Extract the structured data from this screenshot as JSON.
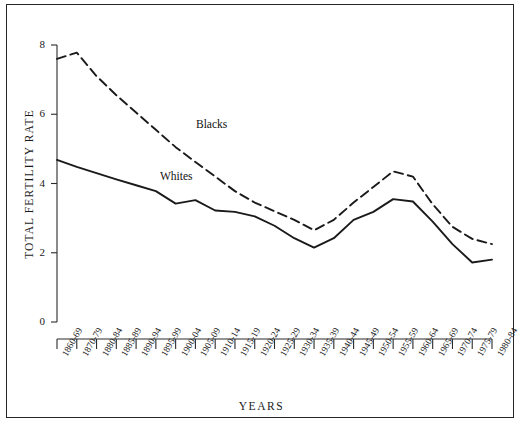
{
  "chart_data": {
    "type": "line",
    "title": "",
    "xlabel": "YEARS",
    "ylabel": "TOTAL FERTILITY RATE",
    "ylim": [
      0,
      8
    ],
    "yticks": [
      0,
      2,
      4,
      6,
      8
    ],
    "grid": false,
    "legend_position": "inline-annotation",
    "categories": [
      "1860-69",
      "1870-79",
      "1880-84",
      "1885-89",
      "1890-94",
      "1895-99",
      "1900-04",
      "1905-09",
      "1910-14",
      "1915-19",
      "1920-24",
      "1925-29",
      "1930-34",
      "1935-39",
      "1940-44",
      "1945-49",
      "1950-54",
      "1955-59",
      "1960-64",
      "1965-69",
      "1970-74",
      "1975-79",
      "1980-84"
    ],
    "series": [
      {
        "name": "Blacks",
        "style": "dashed",
        "color": "#1a1a1a",
        "values": [
          7.6,
          7.78,
          7.1,
          6.55,
          6.05,
          5.55,
          5.05,
          4.62,
          4.2,
          3.78,
          3.45,
          3.2,
          2.95,
          2.65,
          2.95,
          3.45,
          3.9,
          4.35,
          4.2,
          3.4,
          2.75,
          2.4,
          2.25
        ]
      },
      {
        "name": "Whites",
        "style": "solid",
        "color": "#1a1a1a",
        "values": [
          4.68,
          4.48,
          4.3,
          4.12,
          3.95,
          3.78,
          3.42,
          3.52,
          3.22,
          3.18,
          3.05,
          2.78,
          2.42,
          2.15,
          2.42,
          2.95,
          3.18,
          3.55,
          3.48,
          2.9,
          2.25,
          1.72,
          1.8
        ]
      }
    ],
    "annotations": [
      {
        "text": "Blacks",
        "series": "Blacks"
      },
      {
        "text": "Whites",
        "series": "Whites"
      }
    ]
  },
  "axis": {
    "y_tick_labels": [
      "8",
      "6",
      "4",
      "2",
      "0"
    ],
    "y_title": "TOTAL FERTILITY RATE",
    "x_title": "YEARS"
  }
}
